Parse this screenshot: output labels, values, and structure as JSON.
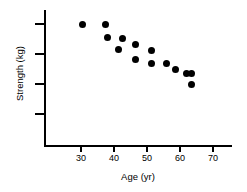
{
  "chart_data": {
    "type": "scatter",
    "title": "",
    "xlabel": "Age (yr)",
    "ylabel": "Strength (kg)",
    "xlim": [
      24,
      72
    ],
    "ylim": [
      0,
      100
    ],
    "grid": false,
    "legend": null,
    "x_ticks": [
      30,
      40,
      50,
      60,
      70
    ],
    "x_tick_labels": [
      "30",
      "40",
      "50",
      "60",
      "70"
    ],
    "y_ticks": [
      40,
      55,
      70,
      85
    ],
    "y_tick_labels": [
      "",
      "",
      "",
      ""
    ],
    "marker": {
      "shape": "circle",
      "color": "#000000",
      "size_px": 7
    },
    "n_points": 14,
    "points": [
      {
        "x": 30.5,
        "y": 83.0
      },
      {
        "x": 37.5,
        "y": 83.0
      },
      {
        "x": 38.0,
        "y": 76.5
      },
      {
        "x": 42.5,
        "y": 76.0
      },
      {
        "x": 41.5,
        "y": 70.5
      },
      {
        "x": 46.5,
        "y": 73.0
      },
      {
        "x": 46.5,
        "y": 65.5
      },
      {
        "x": 51.5,
        "y": 70.0
      },
      {
        "x": 51.5,
        "y": 63.5
      },
      {
        "x": 56.0,
        "y": 63.5
      },
      {
        "x": 58.5,
        "y": 60.5
      },
      {
        "x": 62.0,
        "y": 58.5
      },
      {
        "x": 63.5,
        "y": 58.5
      },
      {
        "x": 63.5,
        "y": 53.0
      }
    ]
  },
  "axes": {
    "x_label": "Age (yr)",
    "y_label": "Strength (kg)",
    "x_tick_labels": [
      "30",
      "40",
      "50",
      "60",
      "70"
    ]
  }
}
